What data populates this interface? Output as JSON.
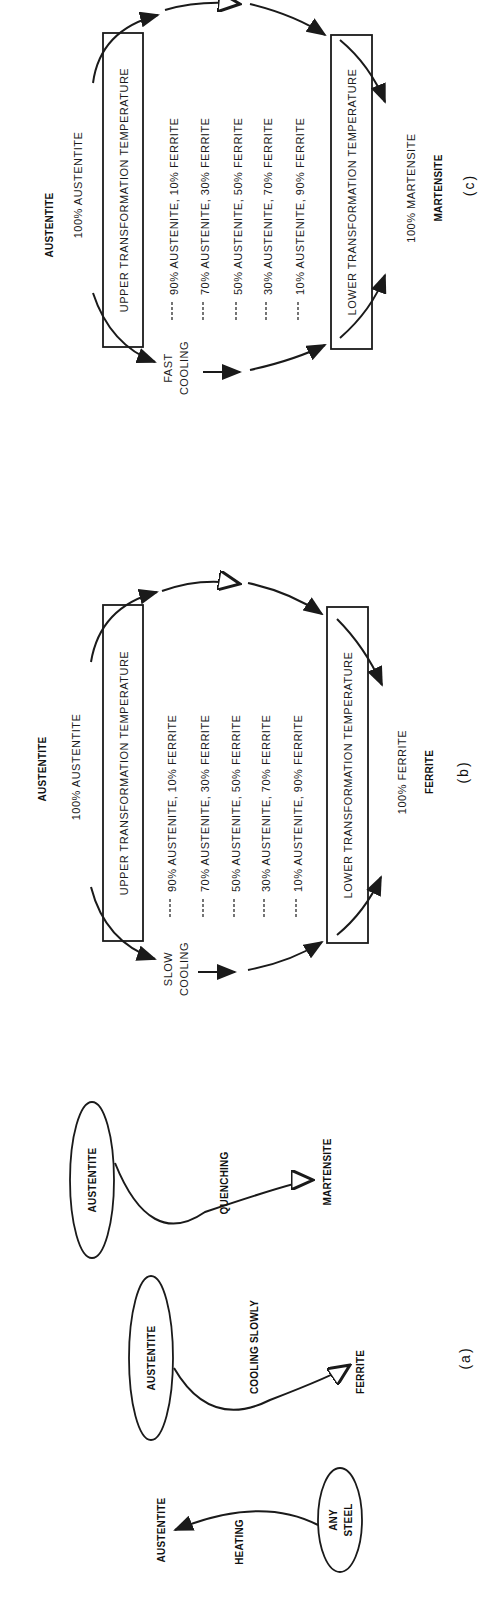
{
  "diagram_a": {
    "caption": "(a)",
    "heating": {
      "start": "ANY STEEL",
      "start_line1": "ANY",
      "start_line2": "STEEL",
      "process": "HEATING",
      "result": "AUSTENTITE"
    },
    "slow": {
      "start": "AUSTENTITE",
      "process": "COOLING SLOWLY",
      "result": "FERRITE"
    },
    "quench": {
      "start": "AUSTENTITE",
      "process": "QUENCHING",
      "result": "MARTENSITE"
    }
  },
  "diagram_b": {
    "caption": "(b)",
    "start_phase": "AUSTENTITE",
    "start_pct": "100% AUSTENTITE",
    "upper_box": "UPPER TRANSFORMATION TEMPERATURE",
    "lower_box": "LOWER TRANSFORMATION TEMPERATURE",
    "process_line1": "SLOW",
    "process_line2": "COOLING",
    "rows": [
      "------ 90% AUSTENITE, 10% FERRITE",
      "------ 70% AUSTENITE, 30% FERRITE",
      "------ 50% AUSTENITE, 50% FERRITE",
      "------ 30% AUSTENITE, 70% FERRITE",
      "------ 10% AUSTENITE, 90% FERRITE"
    ],
    "end_pct": "100% FERRITE",
    "end_phase": "FERRITE"
  },
  "diagram_c": {
    "caption": "(c)",
    "start_phase": "AUSTENTITE",
    "start_pct": "100% AUSTENTITE",
    "upper_box": "UPPER TRANSFORMATION TEMPERATURE",
    "lower_box": "LOWER TRANSFORMATION TEMPERATURE",
    "process_line1": "FAST",
    "process_line2": "COOLING",
    "rows": [
      "------ 90% AUSTENITE, 10% FERRITE",
      "------ 70% AUSTENITE, 30% FERRITE",
      "------ 50% AUSTENITE, 50% FERRITE",
      "------ 30% AUSTENITE, 70% FERRITE",
      "------ 10% AUSTENITE, 90% FERRITE"
    ],
    "end_pct": "100% MARTENSITE",
    "end_phase": "MARTENSITE"
  }
}
